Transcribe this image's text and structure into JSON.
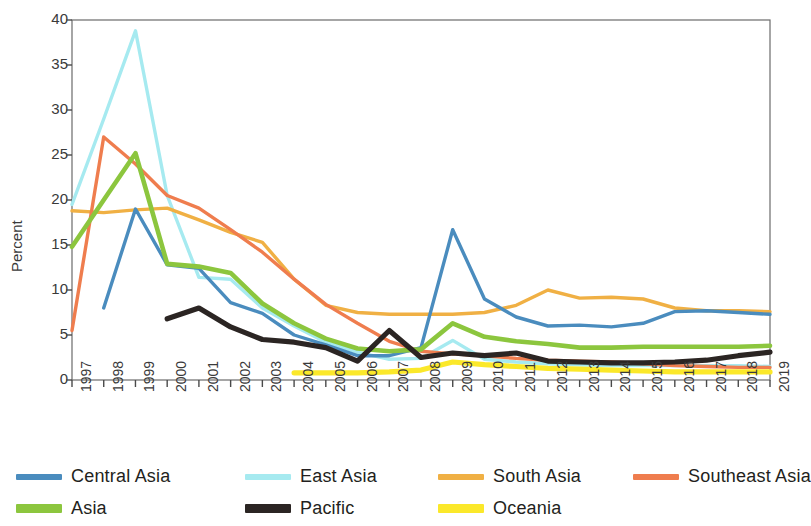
{
  "chart_data": {
    "type": "line",
    "title": "",
    "xlabel": "",
    "ylabel": "Percent",
    "ylim": [
      0,
      40
    ],
    "ytick_step": 5,
    "yticks": [
      0,
      5,
      10,
      15,
      20,
      25,
      30,
      35,
      40
    ],
    "grid": false,
    "legend_position": "bottom",
    "x": [
      1997,
      1998,
      1999,
      2000,
      2001,
      2002,
      2003,
      2004,
      2005,
      2006,
      2007,
      2008,
      2009,
      2010,
      2011,
      2012,
      2013,
      2014,
      2015,
      2016,
      2017,
      2018,
      2019
    ],
    "categories": [
      "1997",
      "1998",
      "1999",
      "2000",
      "2001",
      "2002",
      "2003",
      "2004",
      "2005",
      "2006",
      "2007",
      "2008",
      "2009",
      "2010",
      "2011",
      "2012",
      "2013",
      "2014",
      "2015",
      "2016",
      "2017",
      "2018",
      "2019"
    ],
    "series": [
      {
        "name": "Central Asia",
        "color": "#4a8cbe",
        "width": 3.4,
        "values": [
          null,
          8.0,
          19.0,
          12.8,
          12.4,
          8.6,
          7.4,
          5.0,
          3.9,
          2.7,
          2.7,
          3.6,
          16.7,
          9.0,
          7.0,
          6.0,
          6.1,
          5.9,
          6.3,
          7.6,
          7.7,
          7.5,
          7.3
        ]
      },
      {
        "name": "East Asia",
        "color": "#a6eaf0",
        "width": 3.4,
        "values": [
          19.5,
          29.0,
          38.8,
          20.5,
          11.4,
          11.2,
          8.0,
          6.0,
          4.2,
          3.1,
          2.3,
          2.4,
          4.4,
          2.3,
          2.0,
          1.8,
          1.7,
          1.6,
          1.6,
          1.6,
          1.6,
          1.6,
          1.5
        ]
      },
      {
        "name": "South Asia",
        "color": "#f0b044",
        "width": 3.4,
        "values": [
          18.8,
          18.6,
          18.9,
          19.1,
          17.8,
          16.4,
          15.3,
          11.2,
          8.3,
          7.5,
          7.3,
          7.3,
          7.3,
          7.5,
          8.3,
          10.0,
          9.1,
          9.2,
          9.0,
          8.0,
          7.7,
          7.7,
          7.6
        ]
      },
      {
        "name": "Southeast Asia",
        "color": "#ef7d4e",
        "width": 3.4,
        "values": [
          5.5,
          27.0,
          24.0,
          20.5,
          19.1,
          16.7,
          14.2,
          11.2,
          8.4,
          6.3,
          4.3,
          3.2,
          2.9,
          2.7,
          2.4,
          2.2,
          2.1,
          2.0,
          1.8,
          1.6,
          1.5,
          1.4,
          1.4
        ]
      },
      {
        "name": "Asia",
        "color": "#8cc63e",
        "width": 4.6,
        "values": [
          14.8,
          20.0,
          25.2,
          12.9,
          12.6,
          11.9,
          8.5,
          6.3,
          4.6,
          3.5,
          3.2,
          3.4,
          6.3,
          4.8,
          4.3,
          4.0,
          3.6,
          3.6,
          3.7,
          3.7,
          3.7,
          3.7,
          3.8
        ]
      },
      {
        "name": "Pacific",
        "color": "#2b2523",
        "width": 5.2,
        "values": [
          null,
          null,
          null,
          6.8,
          8.0,
          5.9,
          4.5,
          4.2,
          3.6,
          2.1,
          5.5,
          2.5,
          3.0,
          2.7,
          3.0,
          2.1,
          2.0,
          1.9,
          1.9,
          2.0,
          2.2,
          2.7,
          3.1
        ]
      },
      {
        "name": "Oceania",
        "color": "#fbe82a",
        "width": 5.2,
        "values": [
          null,
          null,
          null,
          null,
          null,
          null,
          null,
          0.8,
          0.8,
          0.8,
          0.9,
          1.1,
          2.0,
          1.7,
          1.5,
          1.3,
          1.2,
          1.1,
          1.0,
          0.9,
          0.9,
          0.9,
          0.9
        ]
      }
    ]
  },
  "axis": {
    "y_title": "Percent"
  },
  "legend": {
    "items": [
      {
        "label": "Central Asia",
        "color": "#4a8cbe",
        "thick": false
      },
      {
        "label": "East Asia",
        "color": "#a6eaf0",
        "thick": false
      },
      {
        "label": "South Asia",
        "color": "#f0b044",
        "thick": false
      },
      {
        "label": "Southeast Asia",
        "color": "#ef7d4e",
        "thick": false
      },
      {
        "label": "Asia",
        "color": "#8cc63e",
        "thick": true
      },
      {
        "label": "Pacific",
        "color": "#2b2523",
        "thick": true
      },
      {
        "label": "Oceania",
        "color": "#fbe82a",
        "thick": true
      }
    ]
  }
}
